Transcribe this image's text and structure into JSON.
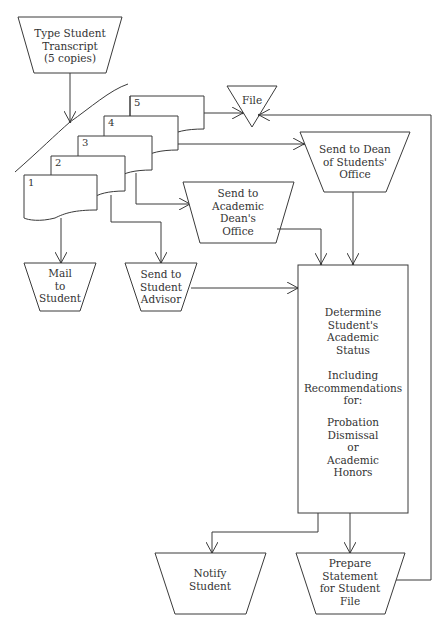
{
  "diagram": {
    "type": "flowchart",
    "nodes": {
      "type_transcript": {
        "label": "Type Student\nTranscript\n(5 copies)",
        "shape": "manual-operation"
      },
      "file": {
        "label": "File",
        "shape": "merge-triangle"
      },
      "copies": [
        "1",
        "2",
        "3",
        "4",
        "5"
      ],
      "dean_students": {
        "label": "Send to Dean\nof Students'\nOffice",
        "shape": "manual-operation"
      },
      "academic_dean": {
        "label": "Send to\nAcademic\nDean's\nOffice",
        "shape": "manual-operation"
      },
      "mail_student": {
        "label": "Mail\nto\nStudent",
        "shape": "manual-operation"
      },
      "student_advisor": {
        "label": "Send to\nStudent\nAdvisor",
        "shape": "manual-operation"
      },
      "determine_status": {
        "label_main": "Determine\nStudent's\nAcademic\nStatus",
        "label_sub": "Including\nRecommendations\nfor:",
        "label_options": "Probation\nDismissal\nor\nAcademic\nHonors",
        "shape": "process"
      },
      "notify_student": {
        "label": "Notify\nStudent",
        "shape": "manual-operation"
      },
      "prepare_statement": {
        "label": "Prepare\nStatement\nfor Student\nFile",
        "shape": "manual-operation"
      }
    },
    "edges": [
      {
        "from": "type_transcript",
        "to": "copies"
      },
      {
        "from": "copy-5",
        "to": "file"
      },
      {
        "from": "copy-4",
        "to": "dean_students"
      },
      {
        "from": "copy-3",
        "to": "academic_dean"
      },
      {
        "from": "copy-2",
        "to": "student_advisor"
      },
      {
        "from": "copy-1",
        "to": "mail_student"
      },
      {
        "from": "academic_dean",
        "to": "determine_status"
      },
      {
        "from": "dean_students",
        "to": "determine_status"
      },
      {
        "from": "student_advisor",
        "to": "determine_status"
      },
      {
        "from": "determine_status",
        "to": "notify_student"
      },
      {
        "from": "determine_status",
        "to": "prepare_statement"
      },
      {
        "from": "prepare_statement",
        "to": "file"
      }
    ]
  }
}
